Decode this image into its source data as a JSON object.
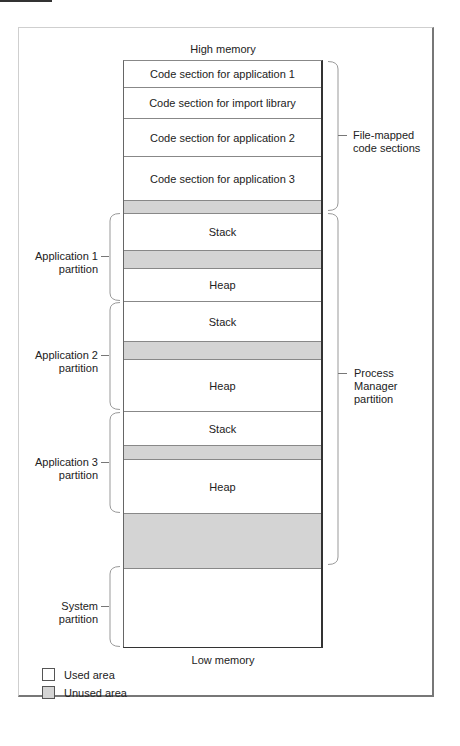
{
  "diagram": {
    "top_label": "High memory",
    "bottom_label": "Low memory",
    "colors": {
      "used": "#ffffff",
      "unused": "#d4d4d4",
      "outline": "#333333"
    },
    "blocks": [
      {
        "label": "Code section for application 1",
        "type": "used",
        "top": 0,
        "height": 27
      },
      {
        "label": "Code section for import library",
        "type": "used",
        "top": 27,
        "height": 31
      },
      {
        "label": "Code section for application 2",
        "type": "used",
        "top": 58,
        "height": 38
      },
      {
        "label": "Code section for application 3",
        "type": "used",
        "top": 96,
        "height": 44
      },
      {
        "label": "",
        "type": "unused",
        "top": 140,
        "height": 13
      },
      {
        "label": "Stack",
        "type": "used",
        "top": 153,
        "height": 37
      },
      {
        "label": "",
        "type": "unused",
        "top": 190,
        "height": 18
      },
      {
        "label": "Heap",
        "type": "used",
        "top": 208,
        "height": 33
      },
      {
        "label": "Stack",
        "type": "used",
        "top": 241,
        "height": 40
      },
      {
        "label": "",
        "type": "unused",
        "top": 281,
        "height": 18
      },
      {
        "label": "Heap",
        "type": "used",
        "top": 299,
        "height": 52
      },
      {
        "label": "Stack",
        "type": "used",
        "top": 351,
        "height": 34
      },
      {
        "label": "",
        "type": "unused",
        "top": 385,
        "height": 14
      },
      {
        "label": "Heap",
        "type": "used",
        "top": 399,
        "height": 54
      },
      {
        "label": "",
        "type": "unused",
        "top": 453,
        "height": 55
      },
      {
        "label": "",
        "type": "used",
        "top": 508,
        "height": 78
      }
    ],
    "left_braces": [
      {
        "line1": "Application 1",
        "line2": "partition",
        "y1": 213,
        "y2": 300
      },
      {
        "line1": "Application 2",
        "line2": "partition",
        "y1": 302,
        "y2": 409
      },
      {
        "line1": "Application 3",
        "line2": "partition",
        "y1": 412,
        "y2": 512
      },
      {
        "line1": "System",
        "line2": "partition",
        "y1": 566,
        "y2": 646
      }
    ],
    "right_braces": [
      {
        "lines": [
          "File-mapped",
          "code sections"
        ],
        "y1": 61,
        "y2": 210
      },
      {
        "lines": [
          "Process",
          "Manager",
          "partition"
        ],
        "y1": 213,
        "y2": 564
      }
    ]
  },
  "legend": {
    "items": [
      {
        "label": "Used area",
        "color": "#ffffff"
      },
      {
        "label": "Unused area",
        "color": "#d4d4d4"
      }
    ]
  }
}
